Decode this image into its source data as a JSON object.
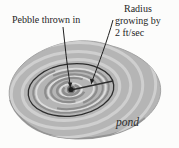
{
  "figure": {
    "pebble_label": "Pebble thrown in",
    "radius_label_line1": "Radius",
    "radius_label_line2": "growing by",
    "radius_label_line3": "2 ft/sec",
    "pond_label": "pond"
  },
  "colors": {
    "background": "#fcfcfb",
    "pond_fill": "#b5b5b5",
    "pond_edge": "#a3a3a3",
    "pond_shadow": "#8f8f8f",
    "ripple_light": "#cfcfcf",
    "ripple_lighter": "#dcdcdc",
    "ripple_dark": "#8d8d8d",
    "circle_ink": "#2e2e2e",
    "ink": "#1f1f1f"
  }
}
